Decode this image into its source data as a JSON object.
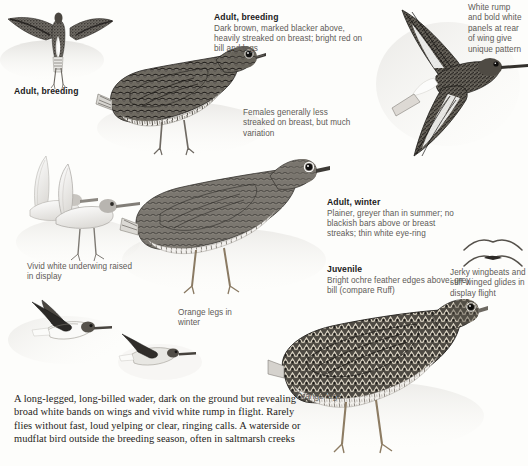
{
  "page": {
    "species_plate": "wader field guide plate",
    "background_color": "#fdfdfb",
    "ink_color": "#3a3734",
    "heading_color": "#1b1b1b",
    "caption_color": "#5d5b57"
  },
  "captions": {
    "adult_breeding_main": {
      "heading": "Adult, breeding",
      "body": "Dark brown, marked blacker above, heavily streaked on breast; bright red on bill and legs"
    },
    "adult_winter": {
      "heading": "Adult, winter",
      "body": "Plainer, greyer than in summer; no blackish bars above or breast streaks; thin white eye-ring"
    },
    "juvenile": {
      "heading": "Juvenile",
      "body": "Bright ochre feather edges above; grey bill (compare Ruff)"
    }
  },
  "labels": {
    "adult_breeding_left": "Adult, breeding"
  },
  "notes": {
    "white_rump": "White rump and bold white panels at rear of wing give unique pattern",
    "females": "Females generally less streaked on breast, but much variation",
    "underwing": "Vivid white underwing raised in display",
    "orange_legs_winter": "Orange legs in winter",
    "orange_legs": "Orange legs",
    "display_flight": "Jerky wingbeats and stiff-winged glides in display flight"
  },
  "summary": {
    "text": "A long-legged, long-billed wader, dark on the ground but revealing broad white bands on wings and vivid white rump in flight. Rarely flies without fast, loud yelping or clear, ringing calls. A waterside or mudflat bird outside the breeding season, often in saltmarsh creeks"
  },
  "figures": {
    "display_flight_top_left": "bird-spread-wings-rear-view",
    "adult_breeding_standing": "bird-standing-breeding-plumage",
    "adult_winter_standing": "bird-standing-winter-plumage",
    "flight_top_right": "bird-in-flight-showing-white-rump",
    "display_pair_left": "two-pale-birds-wings-raised",
    "flight_lower_left_a": "bird-in-flight-profile",
    "flight_lower_left_b": "bird-in-flight-profile",
    "juvenile_standing": "juvenile-bird-standing",
    "wing_diagram_upper": "wing-silhouette-glide",
    "wing_diagram_lower": "wing-silhouette-beat"
  }
}
